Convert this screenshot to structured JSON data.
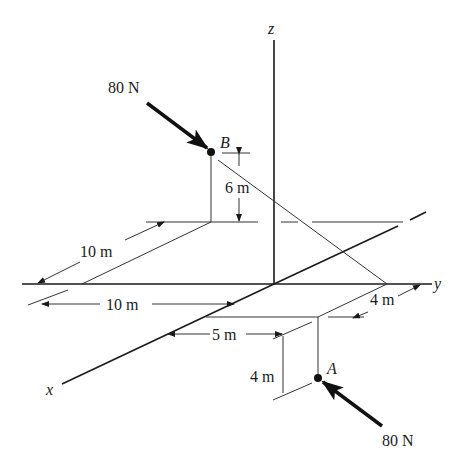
{
  "figure": {
    "axes": {
      "x": "x",
      "y": "y",
      "z": "z"
    },
    "points": {
      "A": {
        "label": "A"
      },
      "B": {
        "label": "B"
      }
    },
    "forces": {
      "at_B": {
        "magnitude_label": "80 N"
      },
      "at_A": {
        "magnitude_label": "80 N"
      }
    },
    "dimensions": {
      "B_height": "6 m",
      "B_x_offset": "10 m",
      "lower_10m": "10 m",
      "A_y_offset": "4 m",
      "A_x_offset": "5 m",
      "A_depth": "4 m"
    },
    "colors": {
      "line": "#1a1a1a",
      "thin_line": "#333333",
      "background": "#ffffff"
    }
  }
}
